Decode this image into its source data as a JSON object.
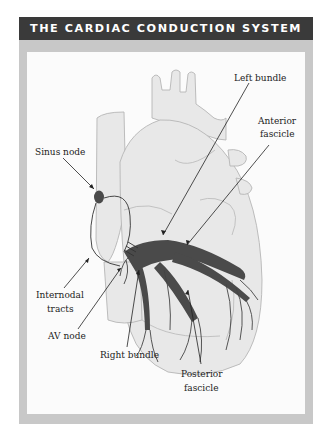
{
  "title": "THE CARDIAC CONDUCTION SYSTEM",
  "colors": {
    "header_bg": "#3a3a3a",
    "frame": "#c8c8c8",
    "heart_fill": "#e6e6e6",
    "heart_outline": "#b5b5b5",
    "conduction": "#4a4a4a"
  },
  "labels": {
    "sinus_node": "Sinus node",
    "left_bundle": "Left bundle",
    "anterior_fascicle_1": "Anterior",
    "anterior_fascicle_2": "fascicle",
    "internodal_tracts_1": "Internodal",
    "internodal_tracts_2": "tracts",
    "av_node": "AV node",
    "right_bundle": "Right bundle",
    "posterior_fascicle_1": "Posterior",
    "posterior_fascicle_2": "fascicle"
  }
}
